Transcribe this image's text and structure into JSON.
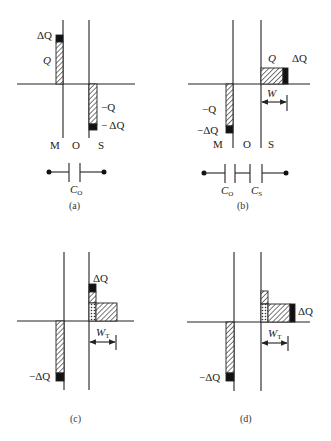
{
  "figure": {
    "colors": {
      "ink": "#222222",
      "background": "#ffffff",
      "charge_delta": "#111111"
    },
    "hatch_legend": {
      "diagonal": "charge Q",
      "solid_black": "additional charge ΔQ",
      "dotted": "mobile charge in semiconductor"
    },
    "panels": [
      {
        "id": "a",
        "caption": "(a)",
        "region_labels": [
          "M",
          "O",
          "S"
        ],
        "charge_labels": {
          "m_top": "ΔQ",
          "m_main": "Q",
          "s_main": "−Q",
          "s_delta": "− ΔQ"
        },
        "circuit": {
          "capacitors": [
            "C_O"
          ],
          "cap_main": "C",
          "cap_sub": "O"
        }
      },
      {
        "id": "b",
        "caption": "(b)",
        "region_labels": [
          "M",
          "O",
          "S"
        ],
        "charge_labels": {
          "s_main": "Q",
          "s_delta": "ΔQ",
          "m_main": "−Q",
          "m_delta": "−ΔQ"
        },
        "width_label": {
          "main": "W",
          "sub": ""
        },
        "circuit": {
          "capacitors": [
            "C_O",
            "C_S"
          ],
          "cap1_main": "C",
          "cap1_sub": "O",
          "cap2_main": "C",
          "cap2_sub": "S"
        }
      },
      {
        "id": "c",
        "caption": "(c)",
        "charge_labels": {
          "s_delta": "ΔQ",
          "m_delta": "−ΔQ"
        },
        "width_label": {
          "main": "W",
          "sub": "T"
        }
      },
      {
        "id": "d",
        "caption": "(d)",
        "charge_labels": {
          "s_delta": "ΔQ",
          "m_delta": "−ΔQ"
        },
        "width_label": {
          "main": "W",
          "sub": "T"
        }
      }
    ]
  }
}
